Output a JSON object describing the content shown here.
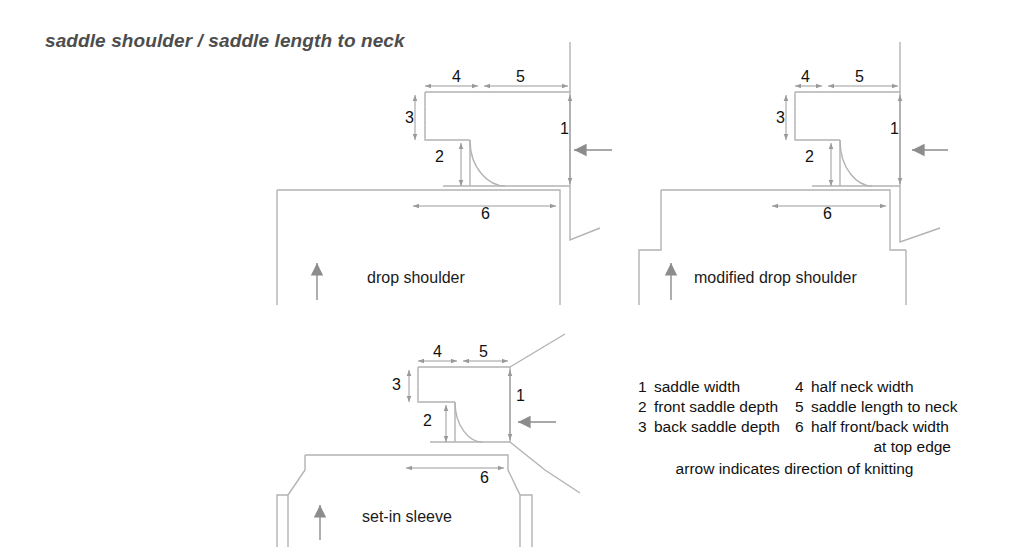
{
  "title": "saddle shoulder / saddle length to neck",
  "colors": {
    "outline": "#b3b3b3",
    "dimension": "#9a9a9a",
    "arrow": "#9a9a9a",
    "text": "#111111",
    "title": "#4d4d4d",
    "background": "#ffffff"
  },
  "diagrams": [
    {
      "id": "drop-shoulder",
      "caption": "drop shoulder",
      "dimensions": [
        {
          "key": "1",
          "label": "saddle width"
        },
        {
          "key": "2",
          "label": "front saddle depth"
        },
        {
          "key": "3",
          "label": "back saddle depth"
        },
        {
          "key": "4",
          "label": "half neck width"
        },
        {
          "key": "5",
          "label": "saddle length to neck"
        },
        {
          "key": "6",
          "label": "half front/back width at top edge"
        }
      ]
    },
    {
      "id": "modified-drop-shoulder",
      "caption": "modified drop shoulder",
      "dimensions": [
        {
          "key": "1",
          "label": "saddle width"
        },
        {
          "key": "2",
          "label": "front saddle depth"
        },
        {
          "key": "3",
          "label": "back saddle depth"
        },
        {
          "key": "4",
          "label": "half neck width"
        },
        {
          "key": "5",
          "label": "saddle length to neck"
        },
        {
          "key": "6",
          "label": "half front/back width at top edge"
        }
      ]
    },
    {
      "id": "set-in-sleeve",
      "caption": "set-in sleeve",
      "dimensions": [
        {
          "key": "1",
          "label": "saddle width"
        },
        {
          "key": "2",
          "label": "front saddle depth"
        },
        {
          "key": "3",
          "label": "back saddle depth"
        },
        {
          "key": "4",
          "label": "half neck width"
        },
        {
          "key": "5",
          "label": "saddle length to neck"
        },
        {
          "key": "6",
          "label": "half front/back width at top edge"
        }
      ]
    }
  ],
  "legend": {
    "rows": [
      {
        "key_left": "1",
        "text_left": "saddle width",
        "key_right": "4",
        "text_right": "half neck width"
      },
      {
        "key_left": "2",
        "text_left": "front saddle depth",
        "key_right": "5",
        "text_right": "saddle length to neck"
      },
      {
        "key_left": "3",
        "text_left": "back saddle depth",
        "key_right": "6",
        "text_right": "half front/back width"
      }
    ],
    "continuation": "at top edge",
    "note": "arrow indicates direction of knitting"
  },
  "marks": {
    "d1": {
      "n1": "1",
      "n2": "2",
      "n3": "3",
      "n4": "4",
      "n5": "5",
      "n6": "6"
    },
    "d2": {
      "n1": "1",
      "n2": "2",
      "n3": "3",
      "n4": "4",
      "n5": "5",
      "n6": "6"
    },
    "d3": {
      "n1": "1",
      "n2": "2",
      "n3": "3",
      "n4": "4",
      "n5": "5",
      "n6": "6"
    }
  }
}
